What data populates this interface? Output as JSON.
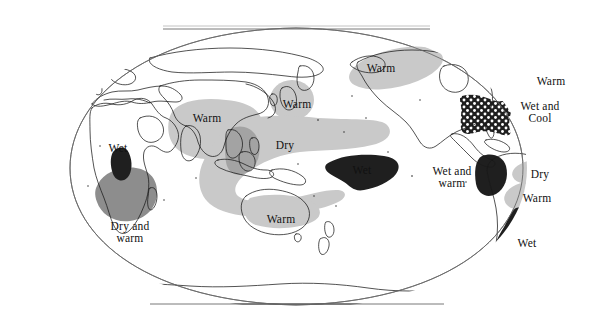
{
  "figure": {
    "title": "",
    "projection": "robinson-style world map",
    "background_color": "#ffffff",
    "coastline_color": "#1a1a1a",
    "frame_color": "#555555",
    "width": 593,
    "height": 336
  },
  "legend_shading": {
    "light_gray": "#c9c9c9",
    "medium_gray": "#8d8d8d",
    "dark": "#1f1f1f",
    "dotted_fill": "#1f1f1f",
    "dot_color": "#ffffff"
  },
  "anomalies": [
    {
      "id": "east-africa-wet",
      "label": "Wet",
      "label_x": 118,
      "label_y": 148,
      "shade": "dark",
      "region": "East Africa / Horn of Africa"
    },
    {
      "id": "southern-africa-dry-warm",
      "label": "Dry and\nwarm",
      "label_x": 130,
      "label_y": 232,
      "shade": "medium_gray",
      "region": "Southern Africa"
    },
    {
      "id": "south-asia-warm",
      "label": "Warm",
      "label_x": 207,
      "label_y": 118,
      "shade": "light_gray",
      "region": "India / South Asia"
    },
    {
      "id": "japan-warm",
      "label": "Warm",
      "label_x": 297,
      "label_y": 104,
      "shade": "light_gray",
      "region": "Japan / Korea"
    },
    {
      "id": "west-pacific-dry",
      "label": "Dry",
      "label_x": 285,
      "label_y": 145,
      "shade": "light_gray",
      "region": "Maritime Continent / Western Pacific"
    },
    {
      "id": "central-pacific-wet",
      "label": "Wet",
      "label_x": 362,
      "label_y": 170,
      "shade": "dark",
      "region": "Central Equatorial Pacific"
    },
    {
      "id": "australia-warm",
      "label": "Warm",
      "label_x": 281,
      "label_y": 219,
      "shade": "light_gray",
      "region": "Northern Australia"
    },
    {
      "id": "alaska-canada-warm",
      "label": "Warm",
      "label_x": 381,
      "label_y": 68,
      "shade": "light_gray",
      "region": "Alaska / Northwest Canada"
    },
    {
      "id": "eastern-us-warm",
      "label": "Warm",
      "label_x": 551,
      "label_y": 81,
      "shade": "light_gray",
      "region": "Eastern United States"
    },
    {
      "id": "southern-us-wet-cool",
      "label": "Wet and\nCool",
      "label_x": 540,
      "label_y": 112,
      "shade": "dotted_fill",
      "region": "Southern United States / Gulf Coast"
    },
    {
      "id": "south-america-wet-warm",
      "label": "Wet and\nwarm",
      "label_x": 452,
      "label_y": 177,
      "shade": "dark",
      "region": "Southeastern South America"
    },
    {
      "id": "ne-brazil-dry",
      "label": "Dry",
      "label_x": 540,
      "label_y": 174,
      "shade": "light_gray",
      "region": "Northeast Brazil"
    },
    {
      "id": "se-south-america-warm",
      "label": "Warm",
      "label_x": 537,
      "label_y": 198,
      "shade": "light_gray",
      "region": "Southeastern South America"
    },
    {
      "id": "chile-wet",
      "label": "Wet",
      "label_x": 527,
      "label_y": 243,
      "shade": "dark",
      "region": "Central / Southern Chile"
    }
  ]
}
